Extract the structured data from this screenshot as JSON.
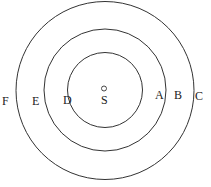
{
  "diagram": {
    "center": {
      "x": 105,
      "y": 90
    },
    "circles": [
      {
        "name": "inner",
        "r": 37.5
      },
      {
        "name": "middle",
        "r": 61
      },
      {
        "name": "outer",
        "r": 88.5
      }
    ],
    "source_marker": {
      "x": 104,
      "y": 88.5,
      "r": 2.5
    },
    "labels": [
      {
        "text": "S",
        "x": 105,
        "y": 104
      },
      {
        "text": "A",
        "x": 159,
        "y": 99
      },
      {
        "text": "B",
        "x": 178,
        "y": 99
      },
      {
        "text": "C",
        "x": 199,
        "y": 99
      },
      {
        "text": "D",
        "x": 67,
        "y": 104
      },
      {
        "text": "E",
        "x": 36,
        "y": 105
      },
      {
        "text": "F",
        "x": 6,
        "y": 105
      }
    ],
    "stroke_color": "#333333"
  }
}
